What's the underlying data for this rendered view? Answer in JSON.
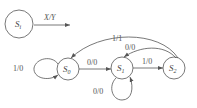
{
  "diagram": {
    "type": "state-transition-diagram",
    "legend": {
      "state": "S",
      "state_sub": "i",
      "label": "X/Y"
    },
    "states": [
      {
        "id": "S0",
        "name": "S",
        "sub": "0"
      },
      {
        "id": "S1",
        "name": "S",
        "sub": "1"
      },
      {
        "id": "S2",
        "name": "S",
        "sub": "2"
      }
    ],
    "transitions": [
      {
        "from": "S0",
        "to": "S0",
        "label": "1/0"
      },
      {
        "from": "S0",
        "to": "S1",
        "label": "0/0"
      },
      {
        "from": "S1",
        "to": "S1",
        "label": "0/0"
      },
      {
        "from": "S1",
        "to": "S2",
        "label": "1/0"
      },
      {
        "from": "S2",
        "to": "S1",
        "label": "0/0"
      },
      {
        "from": "S2",
        "to": "S0",
        "label": "1/1"
      }
    ],
    "colors": {
      "stroke": "#555555",
      "background": "#ffffff"
    }
  }
}
